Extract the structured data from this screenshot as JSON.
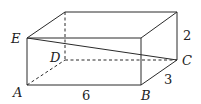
{
  "diagram": {
    "type": "rectangular-box-3d",
    "vertices": {
      "A": {
        "label": "A",
        "x": 27,
        "y": 85
      },
      "B": {
        "label": "B",
        "x": 141,
        "y": 85
      },
      "C": {
        "label": "C",
        "x": 177,
        "y": 60
      },
      "D": {
        "label": "D",
        "x": 65,
        "y": 60
      },
      "E": {
        "label": "E",
        "x": 27,
        "y": 38
      },
      "F": {
        "label": "",
        "x": 141,
        "y": 38
      },
      "G": {
        "label": "",
        "x": 177,
        "y": 12
      },
      "H": {
        "label": "",
        "x": 65,
        "y": 12
      }
    },
    "dimensions": {
      "length": "6",
      "width": "3",
      "height": "2"
    },
    "segments": [
      {
        "from": "E",
        "to": "C",
        "style": "solid",
        "note": "diagonal"
      }
    ]
  }
}
